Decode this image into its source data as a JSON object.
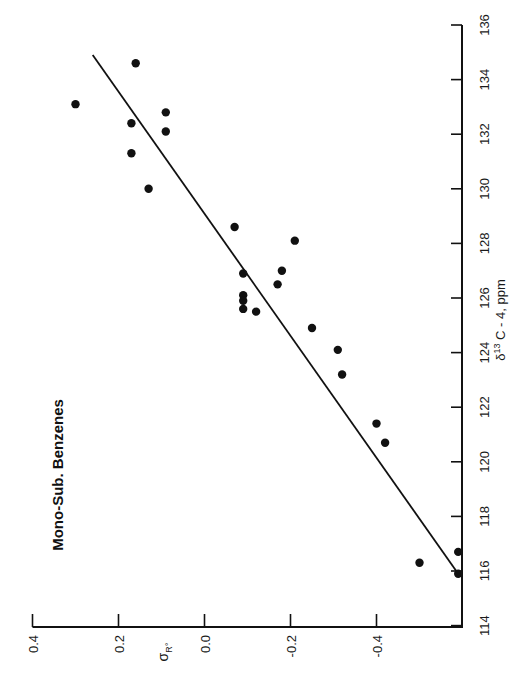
{
  "chart_data": {
    "type": "scatter",
    "orientation": "rotated-90-ccw",
    "title": "Mono-Sub. Benzenes",
    "xlabel": "σR°",
    "xlabel_main": "σ",
    "xlabel_sub": "R°",
    "ylabel": "δ13 C - 4, ppm",
    "ylabel_prefix": "δ",
    "ylabel_sup": "13",
    "ylabel_rest": " C - 4, ppm",
    "x_axis": {
      "name": "sigma_R0",
      "range": [
        0.4,
        -0.6
      ],
      "ticks": [
        0.4,
        0.2,
        0.0,
        -0.2,
        -0.4
      ],
      "tick_labels": [
        "0.4",
        "0.2",
        "0.0",
        "-0.2",
        "-0.4"
      ]
    },
    "y_axis": {
      "name": "delta13C_4_ppm",
      "range": [
        114,
        136
      ],
      "ticks": [
        114,
        116,
        118,
        120,
        122,
        124,
        126,
        128,
        130,
        132,
        134,
        136
      ],
      "tick_labels": [
        "114",
        "116",
        "118",
        "120",
        "122",
        "124",
        "126",
        "128",
        "130",
        "132",
        "134",
        "136"
      ]
    },
    "grid": false,
    "legend": null,
    "points": [
      {
        "sigma": 0.16,
        "ppm": 134.6
      },
      {
        "sigma": 0.3,
        "ppm": 133.1
      },
      {
        "sigma": 0.09,
        "ppm": 132.8
      },
      {
        "sigma": 0.17,
        "ppm": 132.4
      },
      {
        "sigma": 0.09,
        "ppm": 132.1
      },
      {
        "sigma": 0.17,
        "ppm": 131.3
      },
      {
        "sigma": 0.13,
        "ppm": 130.0
      },
      {
        "sigma": -0.07,
        "ppm": 128.6
      },
      {
        "sigma": -0.21,
        "ppm": 128.1
      },
      {
        "sigma": -0.18,
        "ppm": 127.0
      },
      {
        "sigma": -0.09,
        "ppm": 126.9
      },
      {
        "sigma": -0.17,
        "ppm": 126.5
      },
      {
        "sigma": -0.09,
        "ppm": 126.1
      },
      {
        "sigma": -0.09,
        "ppm": 125.9
      },
      {
        "sigma": -0.09,
        "ppm": 125.6
      },
      {
        "sigma": -0.12,
        "ppm": 125.5
      },
      {
        "sigma": -0.25,
        "ppm": 124.9
      },
      {
        "sigma": -0.31,
        "ppm": 124.1
      },
      {
        "sigma": -0.32,
        "ppm": 123.2
      },
      {
        "sigma": -0.4,
        "ppm": 121.4
      },
      {
        "sigma": -0.42,
        "ppm": 120.7
      },
      {
        "sigma": -0.5,
        "ppm": 116.3
      },
      {
        "sigma": -0.59,
        "ppm": 116.7
      },
      {
        "sigma": -0.59,
        "ppm": 115.9
      }
    ],
    "fit_line": {
      "start": {
        "sigma": 0.26,
        "ppm": 134.9
      },
      "end": {
        "sigma": -0.59,
        "ppm": 115.9
      }
    }
  },
  "layout": {
    "sigma_px_origin": 32.5,
    "sigma_px_per_unit": 430,
    "ppm_px_origin": 25,
    "ppm_px_per_unit": 27.3,
    "axis_bottom_y": 627,
    "axis_right_x": 462,
    "point_radius": 4.2
  }
}
